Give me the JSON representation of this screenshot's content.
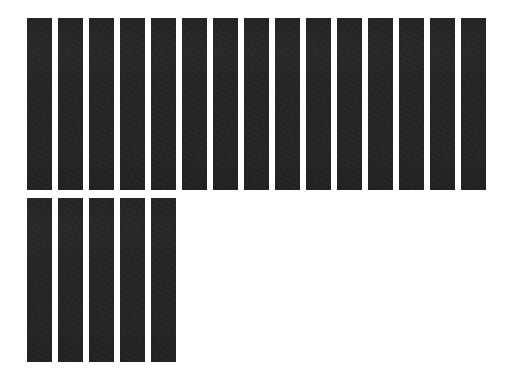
{
  "canvas": {
    "width": 521,
    "height": 382,
    "background_color": "#ffffff"
  },
  "appearance": {
    "bar_color": "#1e1e1e",
    "bar_texture": "noisy-dark-fill"
  },
  "rows": [
    {
      "name": "top-row",
      "left": 27,
      "top": 18,
      "bar_width": 25,
      "bar_height": 172,
      "gap": 6,
      "count": 15,
      "bars": [
        {
          "label": "bar-1"
        },
        {
          "label": "bar-2"
        },
        {
          "label": "bar-3"
        },
        {
          "label": "bar-4"
        },
        {
          "label": "bar-5"
        },
        {
          "label": "bar-6"
        },
        {
          "label": "bar-7"
        },
        {
          "label": "bar-8"
        },
        {
          "label": "bar-9"
        },
        {
          "label": "bar-10"
        },
        {
          "label": "bar-11"
        },
        {
          "label": "bar-12"
        },
        {
          "label": "bar-13"
        },
        {
          "label": "bar-14"
        },
        {
          "label": "bar-15"
        }
      ]
    },
    {
      "name": "bottom-row",
      "left": 27,
      "top": 198,
      "bar_width": 25,
      "bar_height": 164,
      "gap": 6,
      "count": 5,
      "bars": [
        {
          "label": "bar-16"
        },
        {
          "label": "bar-17"
        },
        {
          "label": "bar-18"
        },
        {
          "label": "bar-19"
        },
        {
          "label": "bar-20"
        }
      ]
    }
  ]
}
